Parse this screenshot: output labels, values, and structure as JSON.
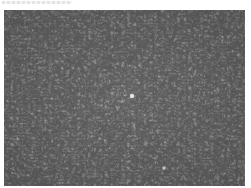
{
  "image": {
    "subject": "phase-contrast micrograph of densely packed spindle-shaped cells",
    "colors": {
      "background": "#ffffff",
      "field": "#8e8e8e",
      "cell_dark": "#2a2a2a",
      "cell_light": "#d6d6d6"
    }
  }
}
